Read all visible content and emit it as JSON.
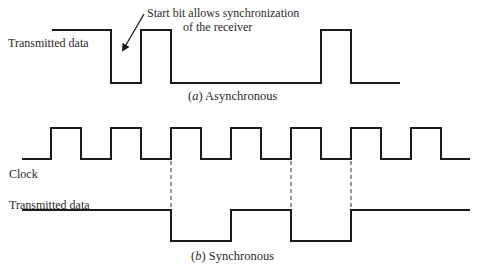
{
  "figure": {
    "async": {
      "label": "Transmitted data",
      "annotation_line1": "Start bit allows synchronization",
      "annotation_line2": "of the receiver",
      "caption_letter": "a",
      "caption_text": "Asynchronous"
    },
    "sync": {
      "clock_label": "Clock",
      "data_label": "Transmitted data",
      "caption_letter": "b",
      "caption_text": "Synchronous"
    },
    "colors": {
      "line": "#1a1a1a",
      "text": "#2a2a2a",
      "background": "#ffffff"
    }
  }
}
